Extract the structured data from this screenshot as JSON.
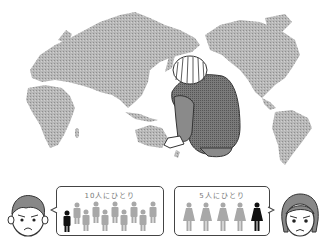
{
  "illustration": {
    "scene": "world-map-with-crouching-person",
    "colors": {
      "map": "#b0b0b0",
      "person_jacket": "#6e6e6e",
      "person_pants": "#8a8a8a",
      "figure_highlight": "#111111",
      "figure_muted": "#a8a8a8",
      "outline": "#333333"
    }
  },
  "left_panel": {
    "face": "man-worried-face",
    "bubble": {
      "title": "10人にひとり",
      "figure_type": "male-figure",
      "total": 10,
      "highlighted": 1
    }
  },
  "right_panel": {
    "face": "woman-worried-face",
    "bubble": {
      "title": "5人にひとり",
      "figure_type": "female-figure",
      "total": 5,
      "highlighted": 1
    }
  }
}
